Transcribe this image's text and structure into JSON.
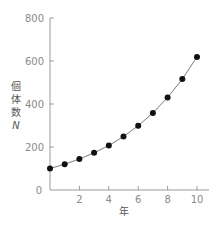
{
  "chart_data": {
    "type": "line",
    "title": "",
    "xlabel": "年",
    "ylabel": "個体数 N",
    "ylabel_chars": [
      "個",
      "体",
      "数"
    ],
    "ylabel_symbol": "N",
    "x": [
      0,
      1,
      2,
      3,
      4,
      5,
      6,
      7,
      8,
      9,
      10
    ],
    "series": [
      {
        "name": "個体数 N",
        "values": [
          100,
          120,
          144,
          173,
          207,
          249,
          299,
          358,
          430,
          516,
          619
        ]
      }
    ],
    "xlim": [
      0,
      10.8
    ],
    "ylim": [
      0,
      800
    ],
    "x_ticks": [
      2,
      4,
      6,
      8,
      10
    ],
    "y_ticks": [
      0,
      200,
      400,
      600,
      800
    ],
    "origin_label": "0",
    "grid": false,
    "legend": "none",
    "markers": "filled-circle"
  },
  "colors": {
    "axis": "#9a9a9a",
    "line": "#7a7a7a",
    "marker": "#111111",
    "text": "#8a8a8a"
  }
}
